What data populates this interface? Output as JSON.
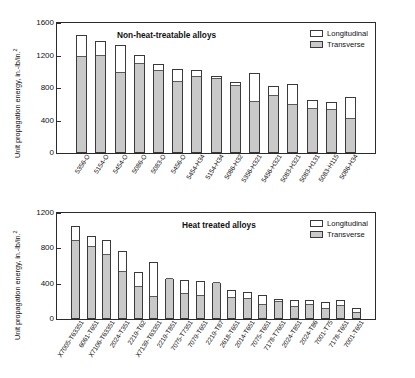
{
  "figure": {
    "background": "#ffffff",
    "axis_color": "#2b2b2b",
    "transverse_color": "#c9c9c9",
    "longitudinal_color": "#ffffff"
  },
  "chart_data": [
    {
      "id": "non-heat-treatable",
      "type": "bar",
      "title": "Non-heat-treatable alloys",
      "xlabel": "",
      "ylabel": "Unit propagation energy, in.-lb/in.",
      "ylabel_exponent": "2",
      "ylim": [
        0,
        1600
      ],
      "yticks": [
        0,
        400,
        800,
        1200,
        1600
      ],
      "grid": false,
      "legend": [
        "Longitudinal",
        "Transverse"
      ],
      "legend_position": "top-right",
      "categories": [
        "5356-O",
        "5154-O",
        "5454-O",
        "5086-O",
        "5083-O",
        "5456-O",
        "5454-H34",
        "5154-H34",
        "5086-H32",
        "5356-H321",
        "5456-H321",
        "5083-H321",
        "5083-H131",
        "5083-H115",
        "5086-H34"
      ],
      "series": [
        {
          "name": "Longitudinal",
          "values": [
            1450,
            1375,
            1325,
            1210,
            1095,
            1040,
            1025,
            950,
            880,
            980,
            830,
            850,
            655,
            630,
            685
          ]
        },
        {
          "name": "Transverse",
          "values": [
            1180,
            1195,
            985,
            1100,
            1005,
            880,
            940,
            910,
            825,
            630,
            700,
            590,
            540,
            525,
            420
          ]
        }
      ]
    },
    {
      "id": "heat-treated",
      "type": "bar",
      "title": "Heat treated alloys",
      "xlabel": "",
      "ylabel": "Unit propagation energy, in.-lb/in.",
      "ylabel_exponent": "2",
      "ylim": [
        0,
        1200
      ],
      "yticks": [
        0,
        400,
        800,
        1200
      ],
      "grid": false,
      "legend": [
        "Longitudinal",
        "Transverse"
      ],
      "legend_position": "top-right",
      "categories": [
        "X7005-T63351",
        "6061-T651",
        "X7106-T63351",
        "2024-T351",
        "2219-T62",
        "X7139-T63351",
        "2219-T851",
        "7075-T7351",
        "7079-T651",
        "2219-T87",
        "2618-T651",
        "2014-T651",
        "7075-T651",
        "7178-T7651",
        "2024-T851",
        "2024-T86",
        "7001-T75",
        "7178-T651",
        "7001-T651"
      ],
      "series": [
        {
          "name": "Longitudinal",
          "values": [
            1050,
            945,
            900,
            765,
            535,
            650,
            450,
            440,
            435,
            405,
            325,
            310,
            270,
            230,
            215,
            215,
            190,
            220,
            130
          ]
        },
        {
          "name": "Transverse",
          "values": [
            885,
            815,
            720,
            535,
            365,
            250,
            450,
            285,
            255,
            405,
            240,
            225,
            160,
            195,
            140,
            155,
            115,
            150,
            70
          ]
        }
      ]
    }
  ]
}
